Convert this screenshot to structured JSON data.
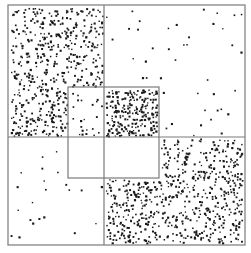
{
  "figure": {
    "width": 251,
    "height": 253,
    "background": "#ffffff",
    "line_color": "#7a7a7a",
    "dot_color": "#1a1a1a",
    "outer_box": {
      "x0": 8,
      "y0": 5,
      "x1": 245,
      "y1": 245
    },
    "dividers": {
      "horizontal_y": 137,
      "vertical_x_top": 104
    },
    "inner_box": {
      "x0": 68,
      "y0": 87,
      "x1": 159,
      "y1": 178,
      "mid_x": 104
    },
    "regions": [
      {
        "name": "top-left-dense",
        "x0": 9,
        "y0": 6,
        "x1": 104,
        "y1": 137,
        "count": 520,
        "exclude_inner": true
      },
      {
        "name": "top-right-sparse",
        "x0": 104,
        "y0": 6,
        "x1": 244,
        "y1": 137,
        "count": 42,
        "exclude_inner": true
      },
      {
        "name": "bottom-left-sparse",
        "x0": 9,
        "y0": 137,
        "x1": 104,
        "y1": 244,
        "count": 22,
        "exclude_inner": true
      },
      {
        "name": "bottom-right-dense",
        "x0": 104,
        "y0": 137,
        "x1": 244,
        "y1": 244,
        "count": 640,
        "exclude_inner": true
      },
      {
        "name": "inner-top-left-sparse",
        "x0": 69,
        "y0": 88,
        "x1": 104,
        "y1": 137,
        "count": 22,
        "exclude_inner": false
      },
      {
        "name": "inner-top-right-dense",
        "x0": 104,
        "y0": 88,
        "x1": 158,
        "y1": 137,
        "count": 230,
        "exclude_inner": false
      },
      {
        "name": "inner-bottom-left-empty",
        "x0": 69,
        "y0": 137,
        "x1": 104,
        "y1": 177,
        "count": 0,
        "exclude_inner": false
      },
      {
        "name": "inner-bottom-right-empty",
        "x0": 104,
        "y0": 137,
        "x1": 158,
        "y1": 177,
        "count": 0,
        "exclude_inner": false
      }
    ]
  }
}
